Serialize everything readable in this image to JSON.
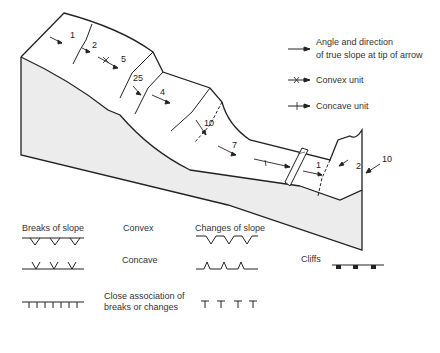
{
  "diagram": {
    "type": "block-diagram-slope-morphology",
    "slope_labels": [
      "1",
      "2",
      "5",
      "25",
      "4",
      "10",
      "7",
      "1",
      "2",
      "10"
    ]
  },
  "legend_top": {
    "arrow": {
      "line1": "Angle and direction",
      "line2": "of true slope at tip of arrow"
    },
    "convex_unit": "Convex unit",
    "concave_unit": "Concave unit"
  },
  "legend_bottom": {
    "breaks_header": "Breaks of slope",
    "changes_header": "Changes of slope",
    "convex": "Convex",
    "concave": "Concave",
    "close_assoc_line1": "Close association of",
    "close_assoc_line2": "breaks or changes",
    "cliffs": "Cliffs"
  }
}
